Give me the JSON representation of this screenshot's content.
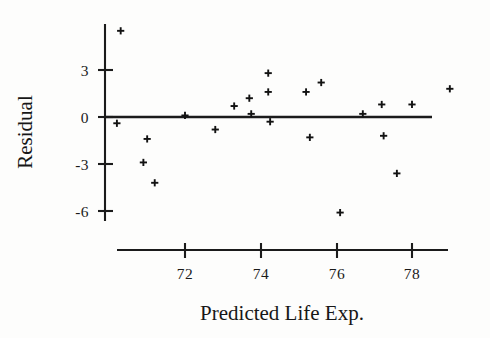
{
  "chart_data": {
    "type": "scatter",
    "title": "",
    "xlabel": "Predicted Life Exp.",
    "ylabel": "Residual",
    "xlim": [
      69.8,
      79.6
    ],
    "ylim": [
      -7.0,
      6.3
    ],
    "grid": false,
    "legend": "none",
    "marker": "plus",
    "xticks": [
      72,
      74,
      76,
      78
    ],
    "xticklabels": [
      "72",
      "74",
      "76",
      "78"
    ],
    "yticks": [
      3,
      0,
      -3,
      -6
    ],
    "yticklabels": [
      "3",
      "0",
      "-3",
      "-6"
    ],
    "reference_line": {
      "axis": "horizontal",
      "value": 0
    },
    "points": [
      {
        "x": 70.3,
        "y": 5.5
      },
      {
        "x": 70.2,
        "y": -0.4
      },
      {
        "x": 70.9,
        "y": -2.9
      },
      {
        "x": 71.0,
        "y": -1.4
      },
      {
        "x": 71.2,
        "y": -4.2
      },
      {
        "x": 72.0,
        "y": 0.1
      },
      {
        "x": 72.8,
        "y": -0.8
      },
      {
        "x": 73.3,
        "y": 0.7
      },
      {
        "x": 73.7,
        "y": 1.2
      },
      {
        "x": 73.75,
        "y": 0.2
      },
      {
        "x": 74.2,
        "y": 2.8
      },
      {
        "x": 74.2,
        "y": 1.6
      },
      {
        "x": 74.25,
        "y": -0.3
      },
      {
        "x": 75.2,
        "y": 1.6
      },
      {
        "x": 75.3,
        "y": -1.3
      },
      {
        "x": 75.6,
        "y": 2.2
      },
      {
        "x": 76.1,
        "y": -6.1
      },
      {
        "x": 76.7,
        "y": 0.2
      },
      {
        "x": 77.2,
        "y": 0.8
      },
      {
        "x": 77.25,
        "y": -1.2
      },
      {
        "x": 77.6,
        "y": -3.6
      },
      {
        "x": 78.0,
        "y": 0.8
      },
      {
        "x": 79.0,
        "y": 1.8
      }
    ]
  },
  "labels": {
    "y_axis_title": "Residual",
    "x_axis_title": "Predicted Life Exp.",
    "y_tick_3": "3",
    "y_tick_0": "0",
    "y_tick_neg3": "-3",
    "y_tick_neg6": "-6",
    "x_tick_72": "72",
    "x_tick_74": "74",
    "x_tick_76": "76",
    "x_tick_78": "78"
  },
  "colors": {
    "ink": "#1a1a1a",
    "background": "#fdfdfc",
    "marker": "#121212"
  }
}
